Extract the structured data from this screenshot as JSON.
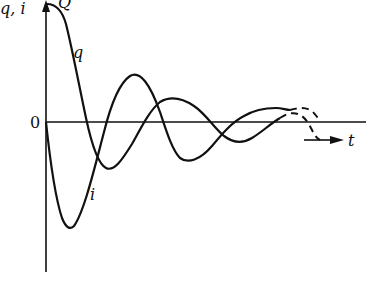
{
  "figure": {
    "type": "damped oscillation diagram",
    "y_axis_label": "q, i",
    "x_axis_label": "t",
    "origin_label": "0",
    "curves": [
      {
        "name": "q",
        "label": "q",
        "description": "charge, starts at maximum Q and decays as damped cosine",
        "peak_label": "Q"
      },
      {
        "name": "i",
        "label": "i",
        "description": "current, starts at 0, first swings negative, damped sine"
      }
    ],
    "dashed_continuation": true,
    "colors": {
      "ink": "#111111",
      "background": "#ffffff"
    }
  }
}
